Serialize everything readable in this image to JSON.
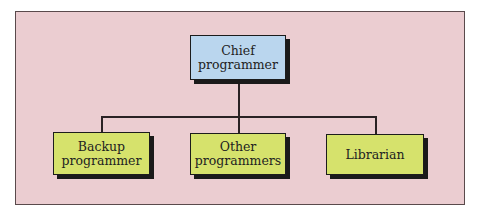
{
  "diagram": {
    "type": "org-chart",
    "colors": {
      "background_panel": "#ebcdd1",
      "root_fill": "#bad6ee",
      "child_fill": "#d6e26c",
      "border": "#1c1c1c",
      "connector": "#2a2224"
    },
    "root": {
      "id": "chief",
      "label": "Chief\nprogrammer"
    },
    "children": [
      {
        "id": "backup",
        "label": "Backup\nprogrammer"
      },
      {
        "id": "other",
        "label": "Other\nprogrammers"
      },
      {
        "id": "librarian",
        "label": "Librarian"
      }
    ],
    "edges": [
      {
        "from": "chief",
        "to": "backup"
      },
      {
        "from": "chief",
        "to": "other"
      },
      {
        "from": "chief",
        "to": "librarian"
      }
    ]
  }
}
